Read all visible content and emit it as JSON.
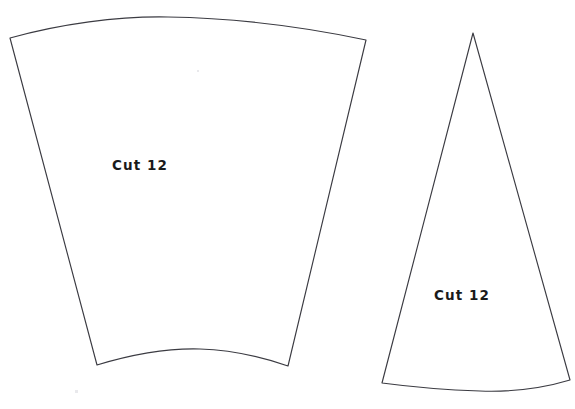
{
  "document": {
    "kind": "hand-drawn sewing pattern sheet",
    "background_color": "#ffffff",
    "ink_color": "#3b3b42",
    "text_color": "#1a1a1a",
    "width": 575,
    "height": 409
  },
  "pieces": [
    {
      "id": "piece-left",
      "name": "wide-curved-panel",
      "label": "Cut 12",
      "label_x": 112,
      "label_y": 170,
      "outline_path": "M 10 38 C 60 24 118 16 168 17 C 228 18 300 26 366 40 L 288 366 C 262 357 232 350 200 349 C 166 348 130 355 97 365 Z"
    },
    {
      "id": "piece-right",
      "name": "narrow-cone-panel",
      "label": "Cut 12",
      "label_x": 434,
      "label_y": 300,
      "outline_path": "M 473 33 L 570 380 C 540 389 508 392 480 391 C 448 390 412 387 382 383 Z"
    }
  ],
  "marks": [
    {
      "name": "paper-smudge",
      "x": 75,
      "y": 390,
      "w": 3,
      "h": 3
    },
    {
      "name": "paper-smudge",
      "x": 197,
      "y": 70,
      "w": 2,
      "h": 2
    }
  ]
}
